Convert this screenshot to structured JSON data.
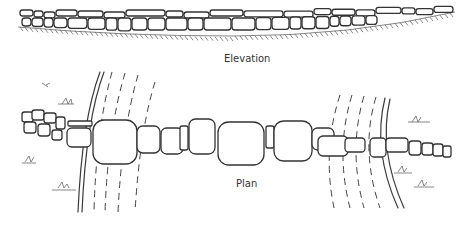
{
  "figure": {
    "labels": {
      "elevation": "Elevation",
      "plan": "Plan"
    },
    "colors": {
      "ink": "#333333",
      "background": "#ffffff"
    }
  }
}
